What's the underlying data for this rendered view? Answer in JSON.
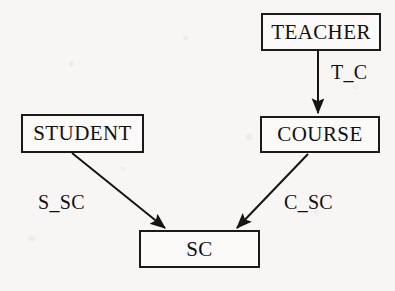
{
  "diagram": {
    "type": "directed-graph",
    "background_color": "#f7f6f4",
    "stroke_color": "#1a1a1a",
    "text_color": "#101010",
    "nodes": [
      {
        "id": "teacher",
        "label": "TEACHER",
        "x": 261,
        "y": 13,
        "width": 120,
        "height": 38
      },
      {
        "id": "student",
        "label": "STUDENT",
        "x": 21,
        "y": 114,
        "width": 123,
        "height": 39
      },
      {
        "id": "course",
        "label": "COURSE",
        "x": 260,
        "y": 116,
        "width": 120,
        "height": 37
      },
      {
        "id": "sc",
        "label": "SC",
        "x": 139,
        "y": 230,
        "width": 121,
        "height": 38
      }
    ],
    "edges": [
      {
        "id": "t_c",
        "label": "T_C",
        "from": "teacher",
        "to": "course",
        "label_x": 331,
        "label_y": 61
      },
      {
        "id": "s_sc",
        "label": "S_SC",
        "from": "student",
        "to": "sc",
        "label_x": 38,
        "label_y": 191
      },
      {
        "id": "c_sc",
        "label": "C_SC",
        "from": "course",
        "to": "sc",
        "label_x": 284,
        "label_y": 191
      }
    ]
  }
}
